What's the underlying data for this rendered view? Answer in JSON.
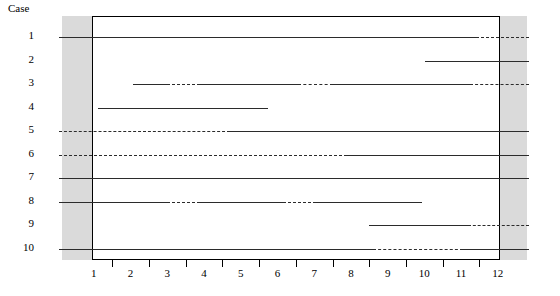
{
  "axis": {
    "case_header": "Case",
    "x_tick_labels": [
      "1",
      "2",
      "3",
      "4",
      "5",
      "6",
      "7",
      "8",
      "9",
      "10",
      "11",
      "12"
    ],
    "case_labels": [
      "1",
      "2",
      "3",
      "4",
      "5",
      "6",
      "7",
      "8",
      "9",
      "10"
    ]
  },
  "colors": {
    "line": "#2b2b2b",
    "band": "#d3d3d3",
    "frame": "#000000",
    "text": "#000000"
  },
  "chart_data": {
    "type": "timeline",
    "title": "",
    "xlabel": "",
    "ylabel": "Case",
    "xlim": [
      0.5,
      12.7
    ],
    "ylim": [
      10.5,
      0.5
    ],
    "grid": false,
    "legend": "none",
    "x_ticks": [
      1,
      2,
      3,
      4,
      5,
      6,
      7,
      8,
      9,
      10,
      11,
      12
    ],
    "categories": [
      "1",
      "2",
      "3",
      "4",
      "5",
      "6",
      "7",
      "8",
      "9",
      "10"
    ],
    "shaded_bands": [
      {
        "x0": 0.06,
        "x1": 0.95
      },
      {
        "x0": 12.06,
        "x1": 12.85
      }
    ],
    "plot_region": {
      "x0": 0.95,
      "x1": 12.06
    },
    "series": [
      {
        "case": "1",
        "segments": [
          {
            "x0": 0.06,
            "x1": 11.4,
            "style": "solid"
          },
          {
            "x0": 11.4,
            "x1": 12.85,
            "style": "dashed"
          }
        ]
      },
      {
        "case": "2",
        "segments": [
          {
            "x0": 10.02,
            "x1": 12.85,
            "style": "solid"
          }
        ]
      },
      {
        "case": "3",
        "segments": [
          {
            "x0": 2.08,
            "x1": 2.98,
            "style": "solid"
          },
          {
            "x0": 2.98,
            "x1": 3.9,
            "style": "dashed"
          },
          {
            "x0": 3.9,
            "x1": 6.55,
            "style": "solid"
          },
          {
            "x0": 6.55,
            "x1": 7.5,
            "style": "dashed"
          },
          {
            "x0": 7.5,
            "x1": 11.25,
            "style": "solid"
          },
          {
            "x0": 11.25,
            "x1": 12.85,
            "style": "dashed"
          }
        ]
      },
      {
        "case": "4",
        "segments": [
          {
            "x0": 1.1,
            "x1": 5.75,
            "style": "solid"
          }
        ]
      },
      {
        "case": "5",
        "segments": [
          {
            "x0": 0.06,
            "x1": 4.7,
            "style": "dashed"
          },
          {
            "x0": 4.7,
            "x1": 12.85,
            "style": "solid"
          }
        ]
      },
      {
        "case": "6",
        "segments": [
          {
            "x0": 0.06,
            "x1": 7.9,
            "style": "dashed"
          },
          {
            "x0": 7.9,
            "x1": 12.85,
            "style": "solid"
          }
        ]
      },
      {
        "case": "7",
        "segments": [
          {
            "x0": 0.06,
            "x1": 12.85,
            "style": "solid"
          }
        ]
      },
      {
        "case": "8",
        "segments": [
          {
            "x0": 0.06,
            "x1": 3.0,
            "style": "solid"
          },
          {
            "x0": 3.0,
            "x1": 3.9,
            "style": "dashed"
          },
          {
            "x0": 3.9,
            "x1": 6.15,
            "style": "solid"
          },
          {
            "x0": 6.15,
            "x1": 7.05,
            "style": "dashed"
          },
          {
            "x0": 7.05,
            "x1": 9.95,
            "style": "solid"
          }
        ]
      },
      {
        "case": "9",
        "segments": [
          {
            "x0": 8.5,
            "x1": 11.18,
            "style": "solid"
          },
          {
            "x0": 11.18,
            "x1": 12.85,
            "style": "dashed"
          }
        ]
      },
      {
        "case": "10",
        "segments": [
          {
            "x0": 0.06,
            "x1": 8.6,
            "style": "solid"
          },
          {
            "x0": 8.6,
            "x1": 11.05,
            "style": "dashed"
          },
          {
            "x0": 11.05,
            "x1": 12.85,
            "style": "solid"
          }
        ]
      }
    ]
  }
}
